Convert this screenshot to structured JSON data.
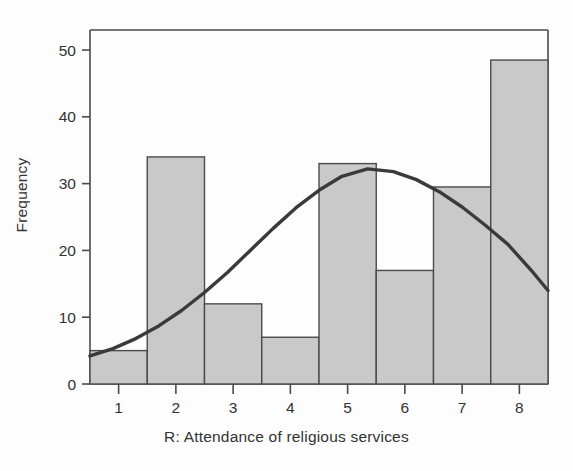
{
  "chart_data": {
    "type": "bar",
    "title": "",
    "subtitle": "",
    "xlabel": "R: Attendance of religious services",
    "ylabel": "Frequency",
    "categories": [
      "1",
      "2",
      "3",
      "4",
      "5",
      "6",
      "7",
      "8"
    ],
    "values": [
      5,
      34,
      12,
      7,
      33,
      17,
      29.5,
      48.5
    ],
    "x_tick_labels": [
      "1",
      "2",
      "3",
      "4",
      "5",
      "6",
      "7",
      "8"
    ],
    "y_tick_labels": [
      "0",
      "10",
      "20",
      "30",
      "40",
      "50"
    ],
    "y_ticks": [
      0,
      10,
      20,
      30,
      40,
      50
    ],
    "ylim": [
      0,
      53
    ],
    "xlim": [
      0.5,
      8.5
    ],
    "grid": false,
    "legend": false,
    "legend_position": "none",
    "bar_fill_color": "#c9c9c9",
    "bar_edge_color": "#4a4a4a",
    "overlay": {
      "type": "line",
      "name": "normal curve",
      "color": "#3a3a3a",
      "peak_x": 5.35,
      "peak_y": 32.2,
      "start_point": [
        0.5,
        4.2
      ],
      "end_point": [
        8.5,
        14.0
      ],
      "points_x": [
        0.5,
        0.9,
        1.3,
        1.7,
        2.1,
        2.5,
        2.9,
        3.3,
        3.7,
        4.1,
        4.5,
        4.9,
        5.35,
        5.8,
        6.2,
        6.6,
        7.0,
        7.4,
        7.8,
        8.2,
        8.5
      ],
      "points_y": [
        4.2,
        5.3,
        6.8,
        8.7,
        11.0,
        13.7,
        16.7,
        20.0,
        23.3,
        26.4,
        29.0,
        31.1,
        32.2,
        31.8,
        30.6,
        28.8,
        26.5,
        23.8,
        20.9,
        17.1,
        14.0
      ]
    }
  },
  "axes": {
    "ylabel": "Frequency",
    "xlabel": "R: Attendance of religious services"
  }
}
